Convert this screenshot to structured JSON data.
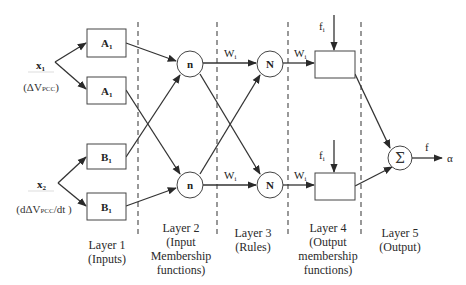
{
  "inputs": [
    {
      "name": "x",
      "sub": "1",
      "desc_pre": "(ΔV",
      "desc_sub": "PCC",
      "desc_post": ")"
    },
    {
      "name": "x",
      "sub": "2",
      "desc_pre": "(dΔV",
      "desc_sub": "PCC",
      "desc_post": "/dt )"
    }
  ],
  "layer1_nodes": [
    {
      "label": "A",
      "sub": "1"
    },
    {
      "label": "A",
      "sub": "1"
    },
    {
      "label": "B",
      "sub": "1"
    },
    {
      "label": "B",
      "sub": "1"
    }
  ],
  "layer2_nodes": [
    {
      "label": "n"
    },
    {
      "label": "n"
    }
  ],
  "layer3_nodes": [
    {
      "label": "N"
    },
    {
      "label": "N"
    }
  ],
  "weights": {
    "label": "W",
    "sub": "i"
  },
  "layer4_inputs": [
    {
      "label": "f",
      "sub": "i"
    },
    {
      "label": "f",
      "sub": "i"
    }
  ],
  "layer5_node": {
    "label": "Σ"
  },
  "output": {
    "signal": "f",
    "result": "α"
  },
  "layers": [
    {
      "title": "Layer 1",
      "lines": [
        "(Inputs)"
      ]
    },
    {
      "title": "Layer 2",
      "lines": [
        "(Input",
        "Membership",
        "functions)"
      ]
    },
    {
      "title": "Layer 3",
      "lines": [
        "(Rules)"
      ]
    },
    {
      "title": "Layer 4",
      "lines": [
        "(Output",
        "membership",
        "functions)"
      ]
    },
    {
      "title": "Layer 5",
      "lines": [
        "(Output)"
      ]
    }
  ],
  "colors": {
    "stroke": "#3a3a3a",
    "dash": "#555555",
    "node_fill": "#ffffff"
  }
}
